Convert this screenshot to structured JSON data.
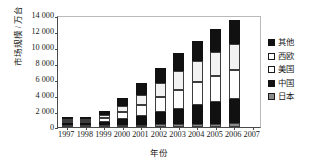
{
  "chart_data": {
    "type": "bar",
    "stacked": true,
    "title": "",
    "xlabel": "年份",
    "ylabel": "市场规模 / 万台",
    "categories": [
      "1997",
      "1998",
      "1999",
      "2000",
      "2001",
      "2002",
      "2003",
      "2004",
      "2005",
      "2006",
      "2007"
    ],
    "ytick_labels": [
      "0",
      "2 000",
      "4 000",
      "6 000",
      "8 000",
      "10 000",
      "12 000",
      "14 000"
    ],
    "ytick_values": [
      0,
      2000,
      4000,
      6000,
      8000,
      10000,
      12000,
      14000
    ],
    "ylim": [
      0,
      14000
    ],
    "grid": false,
    "legend_position": "right",
    "series": [
      {
        "name": "日本",
        "color": "#8b8b8b",
        "values": [
          50,
          120,
          200,
          260,
          300,
          330,
          360,
          400,
          420,
          450,
          0
        ]
      },
      {
        "name": "中国",
        "color": "#111111",
        "values": [
          60,
          200,
          420,
          700,
          1050,
          1500,
          1900,
          2300,
          2700,
          3050,
          0
        ]
      },
      {
        "name": "美国",
        "color": "#ffffff",
        "values": [
          70,
          230,
          460,
          900,
          1400,
          1900,
          2400,
          2900,
          3300,
          3600,
          0
        ]
      },
      {
        "name": "西欧",
        "color": "#f2f2f2",
        "values": [
          60,
          200,
          420,
          820,
          1300,
          1800,
          2300,
          2700,
          3000,
          3300,
          0
        ]
      },
      {
        "name": "其他",
        "color": "#111111",
        "values": [
          60,
          250,
          500,
          920,
          1450,
          1870,
          2240,
          2500,
          2780,
          3000,
          0
        ]
      }
    ],
    "totals": [
      300,
      1000,
      2000,
      3600,
      5500,
      7400,
      9200,
      10800,
      12200,
      13400,
      0
    ]
  },
  "legend": {
    "items": [
      {
        "label": "其他",
        "swatch": "other"
      },
      {
        "label": "西欧",
        "swatch": "eu"
      },
      {
        "label": "美国",
        "swatch": "us"
      },
      {
        "label": "中国",
        "swatch": "cn"
      },
      {
        "label": "日本",
        "swatch": "jp"
      }
    ]
  }
}
